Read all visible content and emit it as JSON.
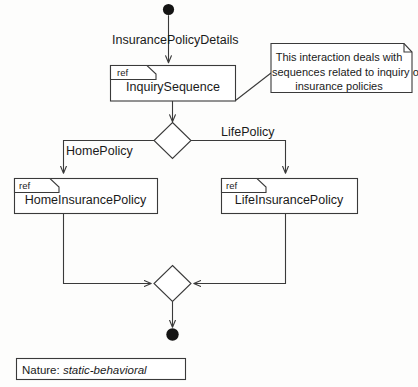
{
  "diagram": {
    "kind": "uml-interaction-overview-diagram",
    "stroke_color": "#3a3a3a",
    "fill_color": "#ffffff",
    "text_color": "#1a1a1a",
    "start_node": {
      "name": "initial-node"
    },
    "end_node": {
      "name": "final-node"
    },
    "flows": {
      "initial_to_inquiry_label": "InsurancePolicyDetails",
      "home_branch_label": "HomePolicy",
      "life_branch_label": "LifePolicy"
    },
    "interaction_uses": [
      {
        "tag": "ref",
        "name": "InquirySequence"
      },
      {
        "tag": "ref",
        "name": "HomeInsurancePolicy"
      },
      {
        "tag": "ref",
        "name": "LifeInsurancePolicy"
      }
    ],
    "note": {
      "line1": "This interaction deals with",
      "line2": "sequences related to inquiry of",
      "line3": "insurance policies"
    },
    "nature": {
      "label": "Nature:",
      "value": "static-behavioral"
    }
  }
}
